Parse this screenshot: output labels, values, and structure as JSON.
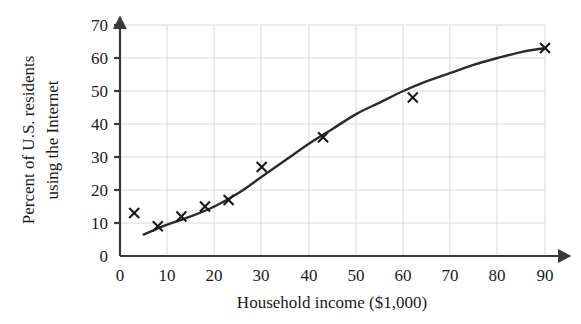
{
  "chart_data": {
    "type": "scatter",
    "title": "",
    "xlabel": "Household income ($1,000)",
    "ylabel": "Percent of U.S. residents using the Internet",
    "ylabel_line1": "Percent of U.S. residents",
    "ylabel_line2": "using the Internet",
    "xlim": [
      0,
      90
    ],
    "ylim": [
      0,
      70
    ],
    "xticks": [
      0,
      10,
      20,
      30,
      40,
      50,
      60,
      70,
      80,
      90
    ],
    "yticks": [
      0,
      10,
      20,
      30,
      40,
      50,
      60,
      70
    ],
    "xtick_labels": [
      "0",
      "10",
      "20",
      "30",
      "40",
      "50",
      "60",
      "70",
      "80",
      "90"
    ],
    "ytick_labels": [
      "0",
      "10",
      "20",
      "30",
      "40",
      "50",
      "60",
      "70"
    ],
    "grid": true,
    "legend": null,
    "marker_style": "x",
    "series": [
      {
        "name": "Observed data",
        "type": "scatter",
        "points": [
          {
            "x": 3,
            "y": 13
          },
          {
            "x": 8,
            "y": 9
          },
          {
            "x": 13,
            "y": 12
          },
          {
            "x": 18,
            "y": 15
          },
          {
            "x": 23,
            "y": 17
          },
          {
            "x": 30,
            "y": 27
          },
          {
            "x": 43,
            "y": 36
          },
          {
            "x": 62,
            "y": 48
          },
          {
            "x": 90,
            "y": 63
          }
        ]
      },
      {
        "name": "Logistic fit curve",
        "type": "line",
        "points": [
          {
            "x": 5,
            "y": 6.5
          },
          {
            "x": 10,
            "y": 9.5
          },
          {
            "x": 15,
            "y": 12.0
          },
          {
            "x": 20,
            "y": 15.0
          },
          {
            "x": 25,
            "y": 19.0
          },
          {
            "x": 30,
            "y": 24.0
          },
          {
            "x": 35,
            "y": 29.0
          },
          {
            "x": 40,
            "y": 34.0
          },
          {
            "x": 45,
            "y": 38.5
          },
          {
            "x": 50,
            "y": 43.0
          },
          {
            "x": 55,
            "y": 46.5
          },
          {
            "x": 60,
            "y": 50.0
          },
          {
            "x": 65,
            "y": 53.0
          },
          {
            "x": 70,
            "y": 55.5
          },
          {
            "x": 75,
            "y": 58.0
          },
          {
            "x": 80,
            "y": 60.0
          },
          {
            "x": 85,
            "y": 61.8
          },
          {
            "x": 90,
            "y": 63.0
          }
        ]
      }
    ],
    "colors": {
      "axis": "#3a3a3a",
      "grid": "#d9d9d9",
      "curve": "#2b2b2b",
      "marker": "#1a1a1a",
      "background": "#ffffff"
    }
  }
}
